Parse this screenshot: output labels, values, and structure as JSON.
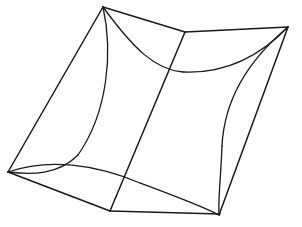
{
  "figure": {
    "background_color": "#ffffff",
    "stroke_color": "#1a1a1a",
    "stroke_width": 1.5,
    "canvas": {
      "width": 302,
      "height": 227
    },
    "vertices": {
      "top": {
        "label": "T",
        "x": 103,
        "y": 7
      },
      "right": {
        "label": "R",
        "x": 288,
        "y": 27
      },
      "left": {
        "label": "L",
        "x": 8,
        "y": 172
      },
      "bottom": {
        "label": "B",
        "x": 219,
        "y": 215
      },
      "back_top": {
        "label": "K",
        "x": 185,
        "y": 32
      },
      "base_left": {
        "label": "P",
        "x": 110,
        "y": 211
      },
      "base_right": {
        "label": "Q",
        "x": 220,
        "y": 214
      }
    },
    "edges": [
      {
        "name": "top-left-upper-edge",
        "kind": "straight",
        "from": "top",
        "to": "left"
      },
      {
        "name": "top-to-back-top-edge",
        "kind": "straight",
        "from": "top",
        "to": "back_top"
      },
      {
        "name": "back-top-to-right-edge",
        "kind": "straight",
        "from": "back_top",
        "to": "right"
      },
      {
        "name": "right-to-bottom-edge",
        "kind": "straight",
        "from": "right",
        "to": "bottom"
      },
      {
        "name": "left-to-base-left-edge",
        "kind": "straight",
        "from": "left",
        "to": "base_left"
      },
      {
        "name": "base-bottom-edge",
        "kind": "straight",
        "from": "base_left",
        "to": "base_right"
      },
      {
        "name": "center-vertical-fold",
        "kind": "straight",
        "from": "back_top",
        "to": "base_left"
      },
      {
        "name": "top-rear-concave-curve",
        "kind": "curve",
        "from": "top",
        "to": "right"
      },
      {
        "name": "top-front-concave-curve",
        "kind": "curve",
        "from": "top",
        "to": "left"
      },
      {
        "name": "left-front-concave-curve",
        "kind": "curve",
        "from": "left",
        "to": "bottom"
      },
      {
        "name": "right-front-concave-curve",
        "kind": "curve",
        "from": "right",
        "to": "bottom"
      }
    ],
    "paths": {
      "outline_top_left_straight": "M 103 7 L 8 172",
      "outline_top_back_straight": "M 103 7 L 185 32",
      "outline_back_right_straight": "M 185 32 L 288 27",
      "outline_right_bottom_straight": "M 288 27 L 219 215",
      "outline_left_base_straight": "M 8 172 L 110 211",
      "base_bottom_straight": "M 110 211 L 220 214",
      "center_fold_straight": "M 185 32 L 110 211",
      "curve_top_to_rear_mid": "M 103 7 C 133 48 155 70 183 72",
      "curve_rear_mid_to_right": "M 183 72 C 228 74 262 54 288 27",
      "curve_top_down_left_panel": "M 103 7 C 113 52 108 112 78 155",
      "curve_left_panel_to_left_vertex": "M 78 155 C 58 175 32 175 8 172",
      "curve_left_to_bottom_front": "M 8 172 C 48 158 95 164 140 183",
      "curve_front_to_bottom_vertex": "M 140 183 C 175 196 202 206 219 215",
      "curve_right_panel_from_right": "M 288 27 C 245 63 224 104 222 146",
      "curve_right_panel_to_bottom": "M 222 146 C 221 175 218 199 219 215"
    }
  }
}
